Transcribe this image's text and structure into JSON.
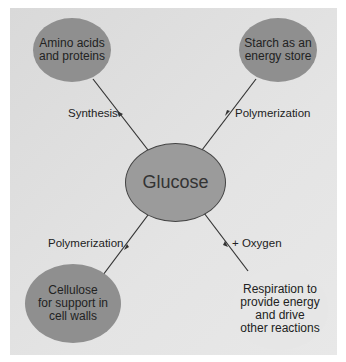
{
  "diagram": {
    "center": {
      "label": "Glucose"
    },
    "nodes": [
      {
        "id": "amino",
        "label_lines": [
          "Amino acids",
          "and proteins"
        ]
      },
      {
        "id": "starch",
        "label_lines": [
          "Starch as an",
          "energy store"
        ]
      },
      {
        "id": "cellulose",
        "label_lines": [
          "Cellulose",
          "for support in",
          "cell walls"
        ]
      },
      {
        "id": "respiration",
        "label_lines": [
          "Respiration to",
          "provide energy",
          "and drive",
          "other reactions"
        ]
      }
    ],
    "edges": [
      {
        "to": "amino",
        "label": "Synthesis"
      },
      {
        "to": "starch",
        "label": "Polymerization"
      },
      {
        "to": "cellulose",
        "label": "Polymerization"
      },
      {
        "to": "respiration",
        "label": "+ Oxygen"
      }
    ],
    "colors": {
      "dark_node": "#8f8f8f",
      "center_node": "#9b9b9b",
      "light_node": "#e6e6e6",
      "background": "#dedede"
    }
  }
}
